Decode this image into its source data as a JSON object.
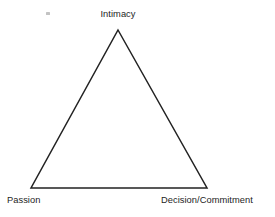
{
  "figure": {
    "type": "triangle-diagram",
    "background_color": "#ffffff",
    "stroke_color": "#222222",
    "stroke_width": 1.5,
    "fill": "none",
    "width": 275,
    "height": 217
  },
  "vertices": {
    "top": {
      "label": "Intimacy",
      "x": 118,
      "y": 30
    },
    "bottom_left": {
      "label": "Passion",
      "x": 31,
      "y": 188
    },
    "bottom_right": {
      "label": "Decision/Commitment",
      "x": 207,
      "y": 188
    }
  },
  "artifacts": {
    "speck_label": "scan-speck"
  }
}
